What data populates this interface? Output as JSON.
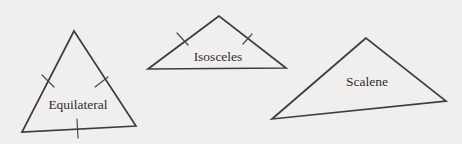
{
  "figure": {
    "background_color": "#f1efed",
    "stroke_color": "#3d3d3d",
    "label_color": "#2e2e2e",
    "triangles": [
      {
        "name": "equilateral",
        "label": "Equilateral",
        "points": "74,31 22,132 136,126",
        "tick_count": 3,
        "ticks": [
          "42,75 54,87",
          "95,87 108,77",
          "77,119 78,138"
        ]
      },
      {
        "name": "isosceles",
        "label": "Isosceles",
        "points": "219,16 148,69 286,68",
        "tick_count": 2,
        "ticks": [
          "177,33 188,45",
          "243,44 252,34"
        ]
      },
      {
        "name": "scalene",
        "label": "Scalene",
        "points": "366,38 272,119 446,101",
        "tick_count": 0,
        "ticks": []
      }
    ]
  }
}
